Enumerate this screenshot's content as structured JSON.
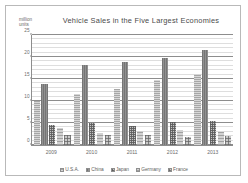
{
  "chart_data": {
    "type": "bar",
    "title": "Vehicle Sales in the Five Largest Economies",
    "xlabel": "",
    "ylabel": "million units",
    "ylim": [
      0,
      25
    ],
    "yticks": [
      0,
      5,
      10,
      15,
      20,
      25
    ],
    "ytick_labels": [
      "0",
      "5",
      "10",
      "15",
      "20",
      "25"
    ],
    "grid": true,
    "legend_position": "bottom",
    "categories": [
      "2009",
      "2010",
      "2011",
      "2012",
      "2013"
    ],
    "series": [
      {
        "name": "U.S.A.",
        "values": [
          10.0,
          11.5,
          12.6,
          14.7,
          15.9
        ]
      },
      {
        "name": "China",
        "values": [
          13.8,
          18.0,
          18.6,
          19.7,
          21.5
        ]
      },
      {
        "name": "Japan",
        "values": [
          4.6,
          5.0,
          4.2,
          5.2,
          5.3
        ]
      },
      {
        "name": "Germany",
        "values": [
          3.8,
          2.8,
          3.2,
          3.3,
          3.0
        ]
      },
      {
        "name": "France",
        "values": [
          2.3,
          2.3,
          2.3,
          1.8,
          2.0
        ]
      }
    ]
  },
  "axis": {
    "unit_line1": "million",
    "unit_line2": "units"
  }
}
